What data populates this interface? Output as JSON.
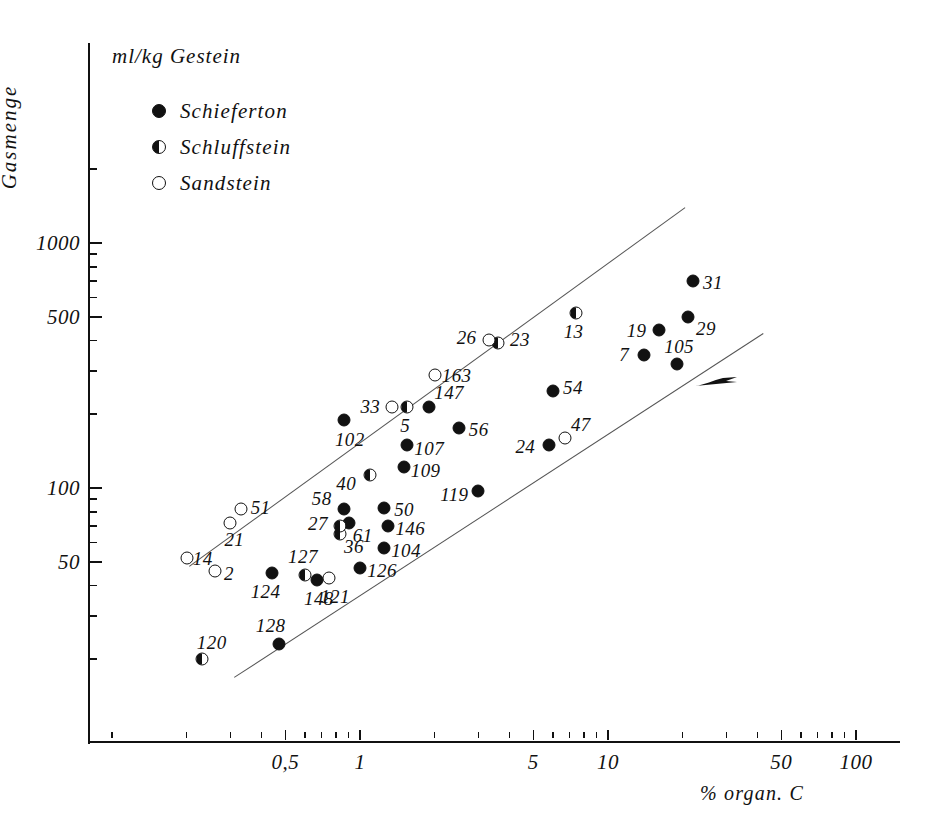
{
  "figure": {
    "units_label": "ml/kg Gestein",
    "y_axis_title": "Gasmenge",
    "x_axis_title": "% organ. C"
  },
  "legend": {
    "items": [
      {
        "label": "Schieferton",
        "marker": "filled"
      },
      {
        "label": "Schluffstein",
        "marker": "half"
      },
      {
        "label": "Sandstein",
        "marker": "open"
      }
    ]
  },
  "chart_data": {
    "type": "scatter",
    "title": "",
    "xlabel": "% organ. C",
    "ylabel": "Gasmenge",
    "y_units": "ml/kg Gestein",
    "xscale": "log",
    "yscale": "log",
    "xlim": [
      0.18,
      160
    ],
    "ylim": [
      14,
      2300
    ],
    "grid": false,
    "legend_position": "top-left",
    "x_ticks": [
      0.5,
      1,
      5,
      10,
      50,
      100
    ],
    "x_tick_labels": [
      "0,5",
      "1",
      "5",
      "10",
      "50",
      "100"
    ],
    "y_ticks": [
      50,
      100,
      500,
      1000
    ],
    "y_tick_labels": [
      "50",
      "100",
      "500",
      "1000"
    ],
    "series": [
      {
        "name": "Schieferton",
        "marker": "filled",
        "points": [
          {
            "label": "102",
            "x": 0.86,
            "y": 190
          },
          {
            "label": "147",
            "x": 1.9,
            "y": 215
          },
          {
            "label": "56",
            "x": 2.5,
            "y": 175
          },
          {
            "label": "107",
            "x": 1.55,
            "y": 150
          },
          {
            "label": "109",
            "x": 1.5,
            "y": 122
          },
          {
            "label": "50",
            "x": 1.25,
            "y": 83
          },
          {
            "label": "146",
            "x": 1.3,
            "y": 70
          },
          {
            "label": "104",
            "x": 1.25,
            "y": 57
          },
          {
            "label": "126",
            "x": 1.0,
            "y": 47
          },
          {
            "label": "119",
            "x": 3.0,
            "y": 97
          },
          {
            "label": "24",
            "x": 5.8,
            "y": 150
          },
          {
            "label": "54",
            "x": 6.0,
            "y": 250
          },
          {
            "label": "31",
            "x": 22,
            "y": 700
          },
          {
            "label": "29",
            "x": 21,
            "y": 500
          },
          {
            "label": "19",
            "x": 16,
            "y": 440
          },
          {
            "label": "7",
            "x": 14,
            "y": 350
          },
          {
            "label": "105",
            "x": 19,
            "y": 320
          },
          {
            "label": "124",
            "x": 0.44,
            "y": 45
          },
          {
            "label": "148",
            "x": 0.67,
            "y": 42
          },
          {
            "label": "128",
            "x": 0.47,
            "y": 23
          },
          {
            "label": "58",
            "x": 0.86,
            "y": 82
          },
          {
            "label": "61",
            "x": 0.9,
            "y": 72
          }
        ]
      },
      {
        "name": "Schluffstein",
        "marker": "half",
        "points": [
          {
            "label": "5",
            "x": 1.55,
            "y": 215
          },
          {
            "label": "40",
            "x": 1.1,
            "y": 113
          },
          {
            "label": "36",
            "x": 0.83,
            "y": 65
          },
          {
            "label": "27",
            "x": 0.83,
            "y": 70
          },
          {
            "label": "23",
            "x": 3.6,
            "y": 390
          },
          {
            "label": "13",
            "x": 7.4,
            "y": 520
          },
          {
            "label": "127",
            "x": 0.6,
            "y": 44
          },
          {
            "label": "120",
            "x": 0.23,
            "y": 20
          }
        ]
      },
      {
        "name": "Sandstein",
        "marker": "open",
        "points": [
          {
            "label": "33",
            "x": 1.35,
            "y": 215
          },
          {
            "label": "163",
            "x": 2.0,
            "y": 290
          },
          {
            "label": "26",
            "x": 3.3,
            "y": 400
          },
          {
            "label": "47",
            "x": 6.7,
            "y": 160
          },
          {
            "label": "51",
            "x": 0.33,
            "y": 82
          },
          {
            "label": "21",
            "x": 0.3,
            "y": 72
          },
          {
            "label": "14",
            "x": 0.2,
            "y": 52
          },
          {
            "label": "2",
            "x": 0.26,
            "y": 46
          },
          {
            "label": "121",
            "x": 0.75,
            "y": 43
          }
        ]
      }
    ],
    "annotations": [
      {
        "name": "upper-envelope-line",
        "type": "line",
        "from": [
          0.205,
          48
        ],
        "to": [
          20.5,
          1400
        ]
      },
      {
        "name": "lower-envelope-line",
        "type": "line",
        "from": [
          0.31,
          17
        ],
        "to": [
          42,
          430
        ]
      },
      {
        "name": "arrow-marker-105",
        "type": "arrow",
        "at_label": "105",
        "direction": "right"
      }
    ]
  }
}
